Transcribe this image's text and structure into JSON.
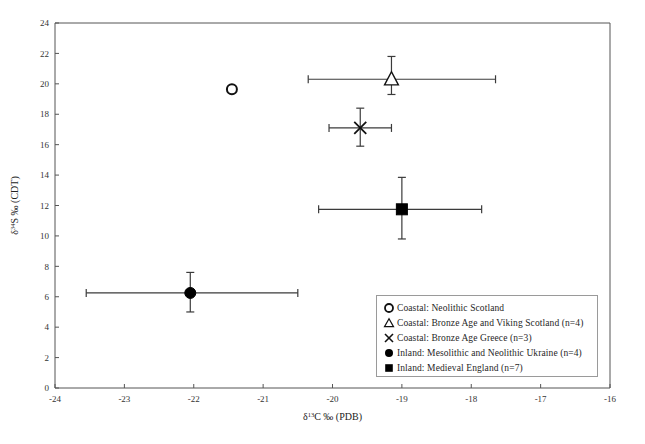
{
  "chart_data": {
    "type": "scatter",
    "title": "",
    "xlabel": "δ¹³C ‰ (PDB)",
    "ylabel": "δ³⁴S ‰ (CDT)",
    "xlim": [
      -24,
      -16
    ],
    "ylim": [
      0,
      24
    ],
    "xticks": [
      -24,
      -23,
      -22,
      -21,
      -20,
      -19,
      -18,
      -17,
      -16
    ],
    "yticks": [
      0,
      2,
      4,
      6,
      8,
      10,
      12,
      14,
      16,
      18,
      20,
      22,
      24
    ],
    "xtick_labels": [
      "-24",
      "-23",
      "-22",
      "-21",
      "-20",
      "-19",
      "-18",
      "-17",
      "-16"
    ],
    "ytick_labels": [
      "0",
      "2",
      "4",
      "6",
      "8",
      "10",
      "12",
      "14",
      "16",
      "18",
      "20",
      "22",
      "24"
    ],
    "grid": false,
    "legend_position": "lower-right",
    "series": [
      {
        "name": "Coastal: Neolithic Scotland",
        "marker": "open-circle",
        "n": null,
        "points": [
          {
            "x": -21.45,
            "y": 19.65,
            "xerr": null,
            "yerr": null
          }
        ]
      },
      {
        "name": "Coastal: Bronze Age and Viking Scotland (n=4)",
        "marker": "open-triangle",
        "n": 4,
        "points": [
          {
            "x": -19.15,
            "y": 20.3,
            "xerr_low": -20.35,
            "xerr_high": -17.65,
            "yerr_low": 19.3,
            "yerr_high": 21.8
          }
        ]
      },
      {
        "name": "Coastal: Bronze Age Greece (n=3)",
        "marker": "cross",
        "n": 3,
        "points": [
          {
            "x": -19.6,
            "y": 17.1,
            "xerr_low": -20.05,
            "xerr_high": -19.15,
            "yerr_low": 15.9,
            "yerr_high": 18.4
          }
        ]
      },
      {
        "name": "Inland: Mesolithic and Neolithic Ukraine (n=4)",
        "marker": "filled-circle",
        "n": 4,
        "points": [
          {
            "x": -22.05,
            "y": 6.25,
            "xerr_low": -23.55,
            "xerr_high": -20.5,
            "yerr_low": 5.0,
            "yerr_high": 7.6
          }
        ]
      },
      {
        "name": "Inland: Medieval England (n=7)",
        "marker": "filled-square",
        "n": 7,
        "points": [
          {
            "x": -19.0,
            "y": 11.75,
            "xerr_low": -20.2,
            "xerr_high": -17.85,
            "yerr_low": 9.8,
            "yerr_high": 13.85
          }
        ]
      }
    ]
  },
  "axes": {
    "x_title_main": "δ",
    "x_title_sup": "13",
    "x_title_rest": "C ‰ (PDB)",
    "y_title_main": "δ",
    "y_title_sup": "34",
    "y_title_rest": "S ‰ (CDT)"
  },
  "legend": {
    "items": [
      {
        "symbol": "open-circle-icon",
        "label": "Coastal: Neolithic Scotland"
      },
      {
        "symbol": "open-triangle-icon",
        "label": "Coastal: Bronze Age and Viking Scotland (n=4)"
      },
      {
        "symbol": "cross-icon",
        "label": "Coastal: Bronze Age Greece (n=3)"
      },
      {
        "symbol": "filled-circle-icon",
        "label": "Inland: Mesolithic and Neolithic Ukraine (n=4)"
      },
      {
        "symbol": "filled-square-icon",
        "label": "Inland: Medieval England (n=7)"
      }
    ]
  },
  "caption": {
    "text": ""
  }
}
